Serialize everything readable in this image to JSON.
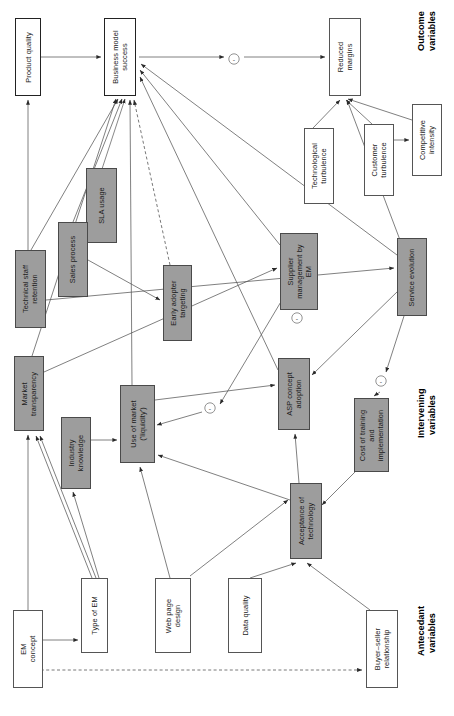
{
  "diagram": {
    "orientation": "rotated-90-ccw",
    "colors": {
      "shaded_fill": "#9d9d9d",
      "plain_fill": "#ffffff",
      "stroke": "#3a3a3a",
      "text": "#1b1b1b"
    },
    "categories": [
      {
        "id": "cat-outcome",
        "line1": "Outcome",
        "line2": "variables"
      },
      {
        "id": "cat-intervening",
        "line1": "Intervening",
        "line2": "variables"
      },
      {
        "id": "cat-antecedant",
        "line1": "Antecedant",
        "line2": "variables"
      }
    ],
    "nodes": [
      {
        "id": "product-quality",
        "label": "Product quality",
        "style": "plain",
        "group": "outcome",
        "x": 15,
        "y": 18,
        "w": 26,
        "h": 78
      },
      {
        "id": "business-model-success",
        "label": "Business model\nsuccess",
        "style": "plain",
        "group": "outcome",
        "x": 104,
        "y": 18,
        "w": 32,
        "h": 78
      },
      {
        "id": "reduced-margins",
        "label": "Reduced\nmargins",
        "style": "plain",
        "group": "outcome",
        "x": 329,
        "y": 18,
        "w": 32,
        "h": 78
      },
      {
        "id": "competitive-intensity",
        "label": "Competitive\nintensity",
        "style": "plain",
        "group": "outcome",
        "x": 412,
        "y": 104,
        "w": 30,
        "h": 72
      },
      {
        "id": "customer-turbulence",
        "label": "Customer\nturbulence",
        "style": "plain",
        "group": "outcome",
        "x": 364,
        "y": 124,
        "w": 30,
        "h": 72
      },
      {
        "id": "technological-turbulence",
        "label": "Technological\nturbulence",
        "style": "plain",
        "group": "outcome",
        "x": 304,
        "y": 128,
        "w": 30,
        "h": 76
      },
      {
        "id": "sla-usage",
        "label": "SLA usage",
        "style": "shaded",
        "group": "intervening",
        "x": 86,
        "y": 168,
        "w": 31,
        "h": 75
      },
      {
        "id": "sales-process",
        "label": "Sales process",
        "style": "shaded",
        "group": "intervening",
        "x": 58,
        "y": 222,
        "w": 30,
        "h": 75
      },
      {
        "id": "technical-staff-retention",
        "label": "Technical staff\nretention",
        "style": "shaded",
        "group": "intervening",
        "x": 15,
        "y": 250,
        "w": 31,
        "h": 78
      },
      {
        "id": "early-adopter-targeting",
        "label": "Early adopter\ntargeting",
        "style": "shaded",
        "group": "intervening",
        "x": 163,
        "y": 265,
        "w": 29,
        "h": 76
      },
      {
        "id": "supplier-management-em",
        "label": "Supplier\nmanagement by\nEM",
        "style": "shaded",
        "group": "intervening",
        "x": 280,
        "y": 233,
        "w": 38,
        "h": 77
      },
      {
        "id": "service-evolution",
        "label": "Service evolution",
        "style": "shaded",
        "group": "intervening",
        "x": 397,
        "y": 238,
        "w": 30,
        "h": 78
      },
      {
        "id": "market-transparency",
        "label": "Market\ntransparency",
        "style": "shaded",
        "group": "intervening",
        "x": 14,
        "y": 356,
        "w": 30,
        "h": 75
      },
      {
        "id": "industry-knowledge",
        "label": "Industry\nknowledge",
        "style": "shaded",
        "group": "intervening",
        "x": 61,
        "y": 417,
        "w": 30,
        "h": 72
      },
      {
        "id": "use-of-market",
        "label": "Use of market\n('liquidity')",
        "style": "shaded",
        "group": "intervening",
        "x": 120,
        "y": 385,
        "w": 35,
        "h": 78
      },
      {
        "id": "asp-concept-adoption",
        "label": "ASP concept\nadoption",
        "style": "shaded",
        "group": "intervening",
        "x": 278,
        "y": 358,
        "w": 32,
        "h": 72
      },
      {
        "id": "cost-of-training",
        "label": "Cost of training\nand\nimplementation",
        "style": "shaded",
        "group": "intervening",
        "x": 354,
        "y": 398,
        "w": 35,
        "h": 74
      },
      {
        "id": "acceptance-of-technology",
        "label": "Acceptance of\ntechnology",
        "style": "shaded",
        "group": "intervening",
        "x": 290,
        "y": 483,
        "w": 32,
        "h": 76
      },
      {
        "id": "em-concept",
        "label": "EM\nconcept",
        "style": "plain",
        "group": "antecedant",
        "x": 13,
        "y": 610,
        "w": 30,
        "h": 78
      },
      {
        "id": "type-of-em",
        "label": "Type of EM",
        "style": "plain",
        "group": "antecedant",
        "x": 81,
        "y": 578,
        "w": 27,
        "h": 75
      },
      {
        "id": "web-page-design",
        "label": "Web page\ndesign",
        "style": "plain",
        "group": "antecedant",
        "x": 155,
        "y": 578,
        "w": 36,
        "h": 75
      },
      {
        "id": "data-quality",
        "label": "Data quality",
        "style": "plain",
        "group": "antecedant",
        "x": 228,
        "y": 578,
        "w": 34,
        "h": 75
      },
      {
        "id": "buyer-seller-relationship",
        "label": "Buyer–seller\nrelationship",
        "style": "plain",
        "group": "antecedant",
        "x": 366,
        "y": 610,
        "w": 32,
        "h": 78
      }
    ],
    "edge_markers": [
      {
        "id": "neg-1",
        "sign": "-",
        "x": 234,
        "y": 59
      },
      {
        "id": "neg-2",
        "sign": "-",
        "x": 297,
        "y": 318
      },
      {
        "id": "neg-3",
        "sign": "-",
        "x": 210,
        "y": 408
      },
      {
        "id": "neg-4",
        "sign": "-",
        "x": 381,
        "y": 381
      }
    ],
    "edges": [
      {
        "from": "product-quality",
        "to": "business-model-success",
        "type": "solid"
      },
      {
        "from": "technical-staff-retention",
        "to": "product-quality",
        "type": "solid"
      },
      {
        "from": "sla-usage",
        "to": "business-model-success",
        "type": "solid"
      },
      {
        "from": "sales-process",
        "to": "business-model-success",
        "type": "solid"
      },
      {
        "from": "early-adopter-targeting",
        "to": "business-model-success",
        "type": "dashed"
      },
      {
        "from": "supplier-management-em",
        "to": "business-model-success",
        "type": "solid"
      },
      {
        "from": "service-evolution",
        "to": "business-model-success",
        "type": "solid"
      },
      {
        "from": "use-of-market",
        "to": "business-model-success",
        "type": "solid"
      },
      {
        "from": "asp-concept-adoption",
        "to": "business-model-success",
        "type": "solid"
      },
      {
        "from": "market-transparency",
        "to": "business-model-success",
        "type": "solid"
      },
      {
        "from": "business-model-success",
        "to": "reduced-margins",
        "type": "solid",
        "marker": "neg-1"
      },
      {
        "from": "competitive-intensity",
        "to": "reduced-margins",
        "type": "solid"
      },
      {
        "from": "customer-turbulence",
        "to": "competitive-intensity",
        "type": "solid"
      },
      {
        "from": "technological-turbulence",
        "to": "reduced-margins",
        "type": "solid"
      },
      {
        "from": "service-evolution",
        "to": "reduced-margins",
        "type": "solid"
      },
      {
        "from": "sales-process",
        "to": "sla-usage",
        "type": "solid"
      },
      {
        "from": "sales-process",
        "to": "early-adopter-targeting",
        "type": "solid"
      },
      {
        "from": "market-transparency",
        "to": "supplier-management-em",
        "type": "solid"
      },
      {
        "from": "industry-knowledge",
        "to": "use-of-market",
        "type": "solid"
      },
      {
        "from": "type-of-em",
        "to": "market-transparency",
        "type": "solid"
      },
      {
        "from": "type-of-em",
        "to": "industry-knowledge",
        "type": "solid"
      },
      {
        "from": "em-concept",
        "to": "type-of-em",
        "type": "solid"
      },
      {
        "from": "em-concept",
        "to": "market-transparency",
        "type": "solid"
      },
      {
        "from": "em-concept",
        "to": "buyer-seller-relationship",
        "type": "dashed"
      },
      {
        "from": "web-page-design",
        "to": "use-of-market",
        "type": "solid"
      },
      {
        "from": "web-page-design",
        "to": "acceptance-of-technology",
        "type": "solid"
      },
      {
        "from": "data-quality",
        "to": "acceptance-of-technology",
        "type": "solid"
      },
      {
        "from": "buyer-seller-relationship",
        "to": "acceptance-of-technology",
        "type": "solid"
      },
      {
        "from": "cost-of-training",
        "to": "acceptance-of-technology",
        "type": "solid"
      },
      {
        "from": "acceptance-of-technology",
        "to": "asp-concept-adoption",
        "type": "solid"
      },
      {
        "from": "acceptance-of-technology",
        "to": "use-of-market",
        "type": "solid"
      },
      {
        "from": "service-evolution",
        "to": "cost-of-training",
        "type": "solid",
        "marker": "neg-4"
      },
      {
        "from": "service-evolution",
        "to": "asp-concept-adoption",
        "type": "solid"
      },
      {
        "from": "supplier-management-em",
        "to": "use-of-market",
        "type": "solid",
        "marker": "neg-3"
      },
      {
        "from": "use-of-market",
        "to": "asp-concept-adoption",
        "type": "solid"
      },
      {
        "from": "technical-staff-retention",
        "to": "service-evolution",
        "type": "solid"
      }
    ]
  }
}
